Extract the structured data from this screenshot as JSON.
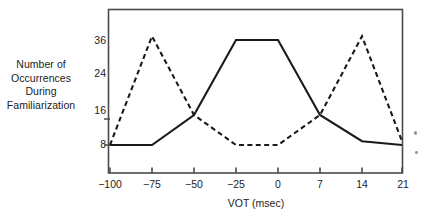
{
  "chart_data": {
    "type": "line",
    "title": "",
    "xlabel": "VOT (msec)",
    "ylabel": "Number of Occurrences During Familiarization",
    "ylabel_lines": [
      "Number of",
      "Occurrences",
      "During",
      "Familiarization"
    ],
    "x_tick_labels": [
      "−100",
      "−75",
      "−50",
      "−25",
      "0",
      "7",
      "14",
      "21"
    ],
    "x_tick_values": [
      -100,
      -75,
      -50,
      -25,
      0,
      7,
      14,
      21
    ],
    "y_tick_labels": [
      "36",
      "24",
      "16",
      "8"
    ],
    "y_tick_values": [
      36,
      24,
      16,
      8
    ],
    "ylim": [
      0,
      44
    ],
    "xlim": [
      -100,
      21
    ],
    "grid": false,
    "legend": false,
    "legend_position": "none",
    "frame": "box",
    "series": [
      {
        "name": "solid-curve",
        "style": "solid",
        "color": "#1a1a1a",
        "x": [
          -100,
          -75,
          -50,
          -25,
          0,
          7,
          14,
          21
        ],
        "values": [
          8,
          8,
          16,
          36,
          36,
          16,
          9,
          8
        ]
      },
      {
        "name": "dashed-curve",
        "style": "dashed",
        "color": "#1a1a1a",
        "x": [
          -100,
          -75,
          -50,
          -25,
          0,
          7,
          14,
          21
        ],
        "values": [
          8,
          37,
          16,
          8,
          8,
          16,
          37,
          9
        ]
      }
    ]
  },
  "axis": {
    "frame_color": "#4a4a4a",
    "tick_color": "#4a4a4a"
  }
}
